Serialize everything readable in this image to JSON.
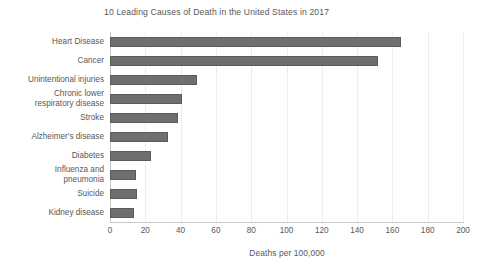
{
  "chart_data": {
    "type": "bar",
    "orientation": "horizontal",
    "title": "10 Leading Causes of Death in the United States in 2017",
    "xlabel": "Deaths per 100,000",
    "ylabel": "",
    "xlim": [
      0,
      200
    ],
    "ylim": null,
    "grid": "vertical",
    "legend": null,
    "xticks": [
      0,
      20,
      40,
      60,
      80,
      100,
      120,
      140,
      160,
      180,
      200
    ],
    "xtick_labels": [
      "0",
      "20",
      "40",
      "60",
      "80",
      "100",
      "120",
      "140",
      "160",
      "180",
      "200"
    ],
    "categories": [
      "Heart Disease",
      "Cancer",
      "Unintentional injuries",
      "Chronic lower respiratory disease",
      "Stroke",
      "Alzheimer's disease",
      "Diabetes",
      "Influenza and pneumonia",
      "Suicide",
      "Kidney disease"
    ],
    "category_lines": [
      [
        "Heart Disease"
      ],
      [
        "Cancer"
      ],
      [
        "Unintentional injuries"
      ],
      [
        "Chronic lower",
        "respiratory disease"
      ],
      [
        "Stroke"
      ],
      [
        "Alzheimer's disease"
      ],
      [
        "Diabetes"
      ],
      [
        "Influenza and",
        "pneumonia"
      ],
      [
        "Suicide"
      ],
      [
        "Kidney disease"
      ]
    ],
    "values": [
      165,
      152,
      49.5,
      41,
      38.5,
      33,
      23,
      15,
      15.5,
      13.5
    ],
    "bar_color": "#6f6f6f",
    "bar_edge_color": "#5b5b5b",
    "gridline_color": "#ededed",
    "axis_color": "#c9c9c9",
    "text_color": "#585858",
    "background_color": "#ffffff"
  }
}
